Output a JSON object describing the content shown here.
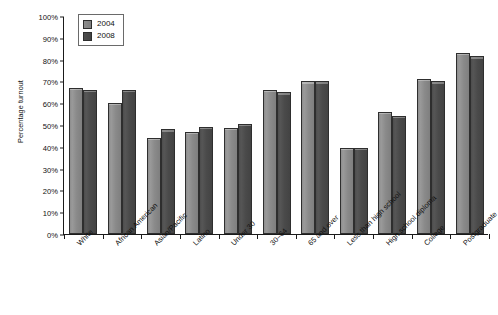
{
  "chart_data": {
    "type": "bar",
    "title": "",
    "xlabel": "",
    "ylabel": "Percentage turnout",
    "ylim": [
      0,
      100
    ],
    "yticks": [
      "0%",
      "10%",
      "20%",
      "30%",
      "40%",
      "50%",
      "60%",
      "70%",
      "80%",
      "90%",
      "100%"
    ],
    "ytick_values": [
      0,
      10,
      20,
      30,
      40,
      50,
      60,
      70,
      80,
      90,
      100
    ],
    "grid": false,
    "legend_position": "top-left",
    "categories": [
      "White",
      "African American",
      "Asian/Pacific",
      "Latino",
      "Under 30",
      "30–64",
      "65 and over",
      "Less than high school",
      "High school diploma",
      "College",
      "Postgraduate"
    ],
    "series": [
      {
        "name": "2004",
        "color": "#8a8a8a",
        "values": [
          67,
          60,
          44,
          47,
          48.5,
          66,
          70,
          39.5,
          56,
          71,
          83
        ]
      },
      {
        "name": "2008",
        "color": "#4a4a4a",
        "values": [
          66,
          66,
          48,
          49,
          50.5,
          65,
          70,
          39.5,
          54,
          70,
          81.5
        ]
      }
    ]
  },
  "legend": {
    "items": [
      {
        "label": "2004",
        "swatch": "light-gray"
      },
      {
        "label": "2008",
        "swatch": "dark-gray"
      }
    ]
  },
  "axes": {
    "y_title": "Percentage turnout"
  }
}
